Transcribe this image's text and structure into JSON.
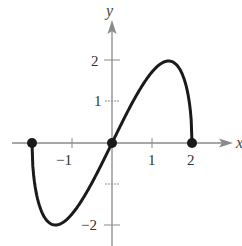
{
  "chart_data": {
    "type": "line",
    "title": "",
    "xlabel": "x",
    "ylabel": "y",
    "xlim": [
      -2.6,
      3.0
    ],
    "ylim": [
      -2.5,
      3.0
    ],
    "grid": false,
    "x_ticks": [
      -2,
      -1,
      1,
      2
    ],
    "x_tick_labels": [
      "-1",
      "1",
      "2"
    ],
    "x_tick_label_values": [
      -1,
      1,
      2
    ],
    "y_ticks": [
      -2,
      -1,
      1,
      2
    ],
    "y_tick_labels": [
      "-2",
      "1",
      "2"
    ],
    "y_tick_label_values": [
      -2,
      1,
      2
    ],
    "series": [
      {
        "name": "f(x)",
        "domain": [
          -2,
          2
        ],
        "x": [
          -2,
          -1.9,
          -1.75,
          -1.6,
          -1.414,
          -1.2,
          -1.0,
          -0.75,
          -0.5,
          -0.25,
          0,
          0.25,
          0.5,
          0.75,
          1.0,
          1.2,
          1.414,
          1.6,
          1.75,
          1.9,
          2
        ],
        "y": [
          0,
          -1.19,
          -1.69,
          -1.92,
          -2.0,
          -1.92,
          -1.73,
          -1.39,
          -0.97,
          -0.5,
          0,
          0.5,
          0.97,
          1.39,
          1.73,
          1.92,
          2.0,
          1.92,
          1.69,
          1.19,
          0
        ]
      }
    ],
    "points": [
      {
        "x": -2,
        "y": 0,
        "marker": "filled-circle"
      },
      {
        "x": 0,
        "y": 0,
        "marker": "filled-circle"
      },
      {
        "x": 2,
        "y": 0,
        "marker": "filled-circle"
      }
    ],
    "colors": {
      "curve": "#1a1a1a",
      "axes": "#888888",
      "points": "#1a1a1a"
    }
  },
  "labels": {
    "x_axis": "x",
    "y_axis": "y",
    "tick_x_neg1": "−1",
    "tick_x_1": "1",
    "tick_x_2": "2",
    "tick_y_2": "2",
    "tick_y_1": "1",
    "tick_y_neg2": "−2"
  }
}
